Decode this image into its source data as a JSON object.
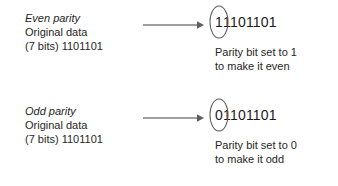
{
  "diagram": {
    "colors": {
      "text": "#262626",
      "bits_text": "#1a1a1a",
      "arrow": "#7f7f7f",
      "oval_stroke": "#5a5a5a",
      "background": "#ffffff"
    },
    "examples": [
      {
        "heading": "Even parity",
        "original_label": "Original data",
        "bits_label": "(7 bits) 1101101",
        "original_data": "1101101",
        "original_bit_count": "7",
        "parity_bit": "1",
        "remaining_bits": "1101101",
        "full_result": "11101101",
        "caption_line1": "Parity bit set to 1",
        "caption_line2": "to make it even",
        "arrow_icon": "right-arrow-icon"
      },
      {
        "heading": "Odd parity",
        "original_label": "Original data",
        "bits_label": "(7 bits) 1101101",
        "original_data": "1101101",
        "original_bit_count": "7",
        "parity_bit": "0",
        "remaining_bits": "1101101",
        "full_result": "01101101",
        "caption_line1": "Parity bit set to 0",
        "caption_line2": "to make it odd",
        "arrow_icon": "right-arrow-icon"
      }
    ]
  }
}
